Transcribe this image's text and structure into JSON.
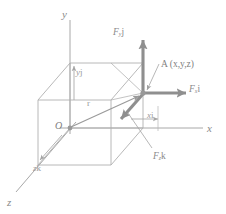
{
  "figure": {
    "type": "3d-vector-diagram",
    "background_color": "#ffffff",
    "line_color": "#a8a8a8",
    "vector_color": "#8f8f8f",
    "text_color": "#8a8a8a",
    "width": 226,
    "height": 214
  },
  "axes": [
    {
      "id": "y-axis",
      "label": "y",
      "direction": "up",
      "label_x": 62,
      "label_y": 9
    },
    {
      "id": "x-axis",
      "label": "x",
      "direction": "right",
      "label_x": 207,
      "label_y": 123
    },
    {
      "id": "z-axis",
      "label": "z",
      "direction": "down-left",
      "label_x": 7,
      "label_y": 197
    }
  ],
  "origin": {
    "label": "O",
    "label_x": 55,
    "label_y": 121,
    "point_x": 70,
    "point_y": 128
  },
  "point_a": {
    "label": "A (x,y,z)",
    "label_x": 161,
    "label_y": 60,
    "point_x": 143,
    "point_y": 93,
    "coordinates": [
      "x",
      "y",
      "z"
    ]
  },
  "vectors": [
    {
      "id": "force-y",
      "label_main": "F",
      "label_sub": "y",
      "label_unit": "j",
      "label_x": 113,
      "label_y": 28,
      "direction": "up",
      "style": "thick-arrow"
    },
    {
      "id": "force-x",
      "label_main": "F",
      "label_sub": "x",
      "label_unit": "i",
      "label_x": 189,
      "label_y": 85,
      "direction": "right",
      "style": "thick-arrow"
    },
    {
      "id": "force-z",
      "label_main": "F",
      "label_sub": "z",
      "label_unit": "k",
      "label_x": 153,
      "label_y": 152,
      "direction": "down-left",
      "style": "thick-arrow"
    },
    {
      "id": "position-vector",
      "label_main": "r",
      "label_sub": "",
      "label_unit": "",
      "label_x": 87,
      "label_y": 99,
      "direction": "origin-to-A",
      "style": "thin-arrow"
    }
  ],
  "dimensions": [
    {
      "id": "dim-y",
      "label_main": "y",
      "label_unit": "j",
      "label_x": 76,
      "label_y": 68,
      "orientation": "vertical"
    },
    {
      "id": "dim-x",
      "label_main": "x",
      "label_unit": "i",
      "label_x": 147,
      "label_y": 111,
      "orientation": "horizontal"
    },
    {
      "id": "dim-z",
      "label_main": "z",
      "label_unit": "k",
      "label_x": 33,
      "label_y": 164,
      "orientation": "diagonal"
    }
  ],
  "box": {
    "id": "reference-box",
    "description": "rectangular parallelepiped showing coordinate components",
    "front_bottom_left_x": 70,
    "front_bottom_left_y": 128,
    "front_top_left_x": 70,
    "front_top_left_y": 63,
    "front_bottom_right_x": 143,
    "front_bottom_right_y": 128,
    "front_top_right_x": 143,
    "front_top_right_y": 63
  }
}
